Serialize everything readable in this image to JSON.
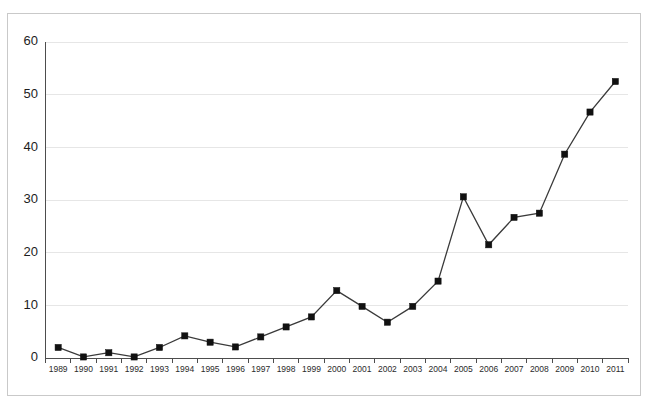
{
  "chart_data": {
    "type": "line",
    "title": "",
    "subtitle": "",
    "xlabel": "",
    "ylabel": "",
    "categories": [
      "1989",
      "1990",
      "1991",
      "1992",
      "1993",
      "1994",
      "1995",
      "1996",
      "1997",
      "1998",
      "1999",
      "2000",
      "2001",
      "2002",
      "2003",
      "2004",
      "2005",
      "2006",
      "2007",
      "2008",
      "2009",
      "2010",
      "2011"
    ],
    "values": [
      2.0,
      0.2,
      1.0,
      0.2,
      2.0,
      4.2,
      3.0,
      2.1,
      4.0,
      5.9,
      7.8,
      12.8,
      9.8,
      6.8,
      9.8,
      14.6,
      30.6,
      21.5,
      26.7,
      27.5,
      38.7,
      46.7,
      52.5
    ],
    "series": [
      {
        "name": "series-1",
        "values": [
          2.0,
          0.2,
          1.0,
          0.2,
          2.0,
          4.2,
          3.0,
          2.1,
          4.0,
          5.9,
          7.8,
          12.8,
          9.8,
          6.8,
          9.8,
          14.6,
          30.6,
          21.5,
          26.7,
          27.5,
          38.7,
          46.7,
          52.5
        ],
        "color": "#3a3a3a",
        "marker": "square"
      }
    ],
    "ylim": [
      0,
      60
    ],
    "yticks": [
      0,
      10,
      20,
      30,
      40,
      50,
      60
    ],
    "ytick_labels": [
      "0",
      "10",
      "20",
      "30",
      "40",
      "50",
      "60"
    ],
    "xtick_labels": [
      "1989",
      "1990",
      "1991",
      "1992",
      "1993",
      "1994",
      "1995",
      "1996",
      "1997",
      "1998",
      "1999",
      "2000",
      "2001",
      "2002",
      "2003",
      "2004",
      "2005",
      "2006",
      "2007",
      "2008",
      "2009",
      "2010",
      "2011"
    ],
    "grid": true,
    "grid_axis": "y",
    "legend": false,
    "legend_position": "none",
    "annotations": []
  },
  "style": {
    "background": "#ffffff",
    "grid_color": "#e6e6e6",
    "axis_color": "#4d4d4d",
    "line_color": "#3a3a3a",
    "marker_color": "#111111",
    "frame_color": "#c9c9c9",
    "tick_label_color": "#1d1d1d"
  },
  "figure": {
    "width": 649,
    "height": 410
  }
}
